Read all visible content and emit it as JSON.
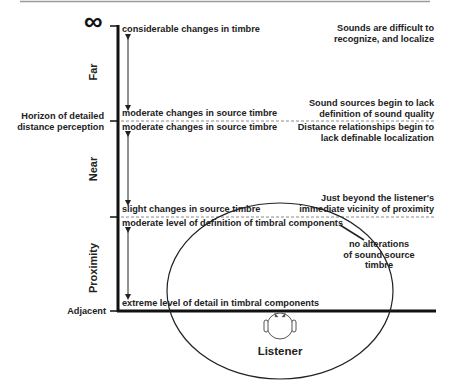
{
  "diagram": {
    "infinity_symbol": "∞",
    "zones": {
      "far": "Far",
      "near": "Near",
      "proximity": "Proximity"
    },
    "axis_labels": {
      "horizon_line1": "Horizon of detailed",
      "horizon_line2": "distance perception",
      "adjacent": "Adjacent"
    },
    "timbre_notes": {
      "far_top": "considerable changes in timbre",
      "far_bottom": "moderate changes in source timbre",
      "near_top": "moderate changes in source timbre",
      "near_bottom": "slight changes in source timbre",
      "proximity_top": "moderate level of definition of timbral components",
      "proximity_bottom": "extreme level of detail in timbral components"
    },
    "right_notes": {
      "far_line1": "Sounds are difficult to",
      "far_line2": "recognize, and localize",
      "horizon_above_line1": "Sound sources begin to lack",
      "horizon_above_line2": "definition of sound quality",
      "horizon_below_line1": "Distance relationships begin to",
      "horizon_below_line2": "lack definable localization",
      "proximity_line1": "Just beyond the listener's",
      "proximity_line2": "immediate vicinity of proximity"
    },
    "ellipse_note": {
      "line1": "no alterations",
      "line2": "of sound source",
      "line3": "timbre"
    },
    "listener_label": "Listener",
    "colors": {
      "ink": "#1a1a1a",
      "dashed": "#8a8a8a",
      "top_rule": "#9a9a9a"
    }
  }
}
